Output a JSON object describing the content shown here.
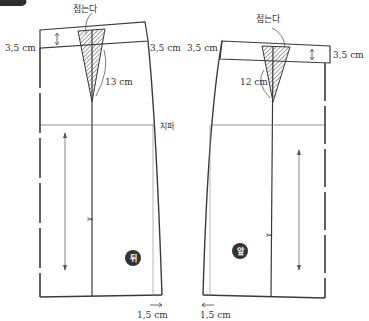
{
  "diagram": {
    "type": "sewing-pattern",
    "colors": {
      "line": "#3a3a3a",
      "thin_line": "#666666",
      "hatch": "#444444",
      "badge_fill": "#333333",
      "corner_tab": "#2e2e2e"
    },
    "back_panel": {
      "fold_label": "접는다",
      "waist_left_label": "3,5 cm",
      "waist_right_label": "3,5 cm",
      "dart_length_label": "13 cm",
      "zipper_label": "지퍼",
      "hem_label": "1,5 cm",
      "badge_label": "뒤"
    },
    "front_panel": {
      "fold_label": "접는다",
      "waist_left_label": "3,5 cm",
      "waist_right_label": "3,5 cm",
      "dart_length_label": "12 cm",
      "hem_label": "1,5 cm",
      "badge_label": "앞"
    },
    "icons": {
      "scissors": "scissors-icon",
      "grainline": "grainline-arrow-icon"
    }
  }
}
